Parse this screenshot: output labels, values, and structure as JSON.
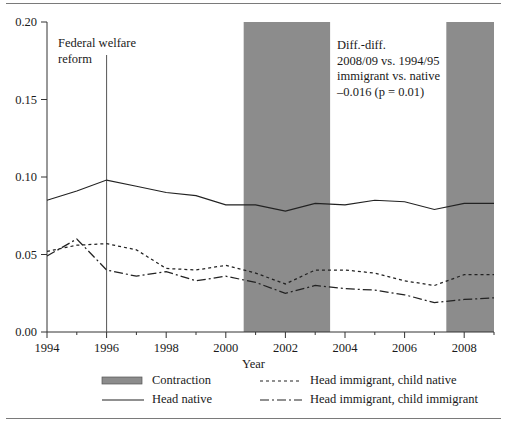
{
  "chart_data": {
    "type": "line",
    "title": "",
    "xlabel": "Year",
    "ylabel": "",
    "xlim": [
      1994,
      2009
    ],
    "ylim": [
      0.0,
      0.2
    ],
    "grid": false,
    "legend_position": "bottom",
    "x": [
      1994,
      1995,
      1996,
      1997,
      1998,
      1999,
      2000,
      2001,
      2002,
      2003,
      2004,
      2005,
      2006,
      2007,
      2008,
      2009
    ],
    "xticks": [
      1994,
      1996,
      1998,
      2000,
      2002,
      2004,
      2006,
      2008
    ],
    "xtick_labels": [
      "1994",
      "1996",
      "1998",
      "2000",
      "2002",
      "2004",
      "2006",
      "2008"
    ],
    "xminorticks": [
      1995,
      1997,
      1999,
      2001,
      2003,
      2005,
      2007,
      2009
    ],
    "yticks": [
      0.0,
      0.05,
      0.1,
      0.15,
      0.2
    ],
    "ytick_labels": [
      "0.00",
      "0.05",
      "0.10",
      "0.15",
      "0.20"
    ],
    "series": [
      {
        "name": "Head native",
        "style": "solid",
        "values": [
          0.085,
          0.091,
          0.098,
          0.094,
          0.09,
          0.088,
          0.082,
          0.082,
          0.078,
          0.083,
          0.082,
          0.085,
          0.084,
          0.079,
          0.083,
          0.083
        ]
      },
      {
        "name": "Head immigrant, child native",
        "style": "dashed",
        "values": [
          0.052,
          0.056,
          0.057,
          0.053,
          0.041,
          0.04,
          0.043,
          0.038,
          0.031,
          0.04,
          0.04,
          0.038,
          0.033,
          0.03,
          0.037,
          0.037
        ]
      },
      {
        "name": "Head immigrant, child immigrant",
        "style": "dashdot",
        "values": [
          0.049,
          0.06,
          0.04,
          0.036,
          0.039,
          0.033,
          0.036,
          0.032,
          0.025,
          0.03,
          0.028,
          0.027,
          0.024,
          0.019,
          0.021,
          0.022
        ]
      }
    ],
    "shaded_bands": [
      {
        "name": "Contraction",
        "start": 2000.6,
        "end": 2003.5
      },
      {
        "name": "Contraction",
        "start": 2007.4,
        "end": 2009.0
      }
    ],
    "vlines": [
      {
        "name": "Federal welfare reform",
        "x": 1996.0
      }
    ],
    "annotations": [
      {
        "name": "welfare-reform-note",
        "lines": [
          "Federal welfare",
          "reform"
        ]
      },
      {
        "name": "diff-in-diff-note",
        "lines": [
          "Diff.-diff.",
          "2008/09 vs. 1994/95",
          "immigrant vs. native",
          "–0.016 (p = 0.01)"
        ]
      }
    ],
    "colors": {
      "band_fill": "#8c8c8c",
      "line": "#222222",
      "axis": "#333333",
      "rule": "#7a7a7a",
      "background": "#ffffff"
    }
  },
  "annotations_text": {
    "welfare_reform": "Federal welfare\nreform",
    "diff_diff": "Diff.-diff.\n2008/09 vs. 1994/95\nimmigrant vs. native\n–0.016 (p = 0.01)"
  },
  "axes": {
    "x_title": "Year"
  },
  "legend": {
    "left": [
      {
        "label": "Contraction",
        "style": "band"
      },
      {
        "label": "Head native",
        "style": "solid"
      }
    ],
    "right": [
      {
        "label": "Head immigrant, child native",
        "style": "dashed"
      },
      {
        "label": "Head immigrant, child immigrant",
        "style": "dashdot"
      }
    ]
  }
}
